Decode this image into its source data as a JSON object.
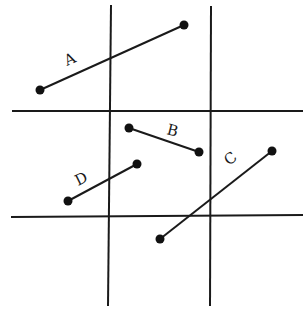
{
  "diagram": {
    "type": "line segments on a 3x3 grid",
    "grid_lines": {
      "vertical": [
        {
          "x1": 111,
          "y1": 5,
          "x2": 108,
          "y2": 306
        },
        {
          "x1": 211,
          "y1": 6,
          "x2": 210,
          "y2": 306
        }
      ],
      "horizontal": [
        {
          "x1": 12,
          "y1": 111,
          "x2": 303,
          "y2": 111
        },
        {
          "x1": 11,
          "y1": 217,
          "x2": 303,
          "y2": 215
        }
      ]
    },
    "segments": [
      {
        "label": "A",
        "x1": 40,
        "y1": 90,
        "x2": 184,
        "y2": 25,
        "label_x": 67,
        "label_y": 66,
        "label_rotate": -24
      },
      {
        "label": "B",
        "x1": 129,
        "y1": 128,
        "x2": 199,
        "y2": 152,
        "label_x": 166,
        "label_y": 134,
        "label_rotate": 14
      },
      {
        "label": "C",
        "x1": 160,
        "y1": 239,
        "x2": 272,
        "y2": 151,
        "label_x": 229,
        "label_y": 166,
        "label_rotate": -38
      },
      {
        "label": "D",
        "x1": 68,
        "y1": 201,
        "x2": 137,
        "y2": 164,
        "label_x": 78,
        "label_y": 186,
        "label_rotate": -26
      }
    ],
    "colors": {
      "ink": "#1a1a1a",
      "background": "#ffffff"
    }
  }
}
